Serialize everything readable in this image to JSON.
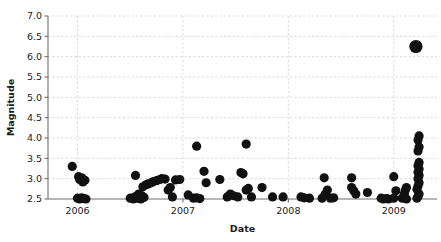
{
  "figure": {
    "background": "#ffffff",
    "marker_color": "#111111",
    "grid_color": "#d8d8d8",
    "axis_color": "#6e6e6e"
  },
  "chart_data": {
    "type": "scatter",
    "title": "",
    "xlabel": "Date",
    "ylabel": "Magnitude",
    "grid": true,
    "legend": null,
    "xlim": [
      2005.72,
      2009.41
    ],
    "ylim": [
      2.45,
      7.05
    ],
    "xticks": [
      2006,
      2007,
      2008,
      2009
    ],
    "xticklabels": [
      "2006",
      "2007",
      "2008",
      "2009"
    ],
    "yticks": [
      2.5,
      3.0,
      3.5,
      4.0,
      4.5,
      5.0,
      5.5,
      6.0,
      6.5,
      7.0
    ],
    "yticklabels": [
      "2.5",
      "3.0",
      "3.5",
      "4.0",
      "4.5",
      "5.0",
      "5.5",
      "6.0",
      "6.5",
      "7.0"
    ],
    "marker_size_default": 4.6,
    "points": [
      {
        "x": 2005.95,
        "y": 3.3
      },
      {
        "x": 2006.01,
        "y": 3.05
      },
      {
        "x": 2006.02,
        "y": 2.98
      },
      {
        "x": 2006.04,
        "y": 3.02
      },
      {
        "x": 2006.05,
        "y": 2.92
      },
      {
        "x": 2006.07,
        "y": 2.96
      },
      {
        "x": 2006.0,
        "y": 2.52
      },
      {
        "x": 2006.02,
        "y": 2.5
      },
      {
        "x": 2006.04,
        "y": 2.53
      },
      {
        "x": 2006.06,
        "y": 2.51
      },
      {
        "x": 2006.08,
        "y": 2.5
      },
      {
        "x": 2006.5,
        "y": 2.52
      },
      {
        "x": 2006.53,
        "y": 2.5
      },
      {
        "x": 2006.55,
        "y": 2.56
      },
      {
        "x": 2006.57,
        "y": 2.52
      },
      {
        "x": 2006.6,
        "y": 2.5
      },
      {
        "x": 2006.58,
        "y": 2.62
      },
      {
        "x": 2006.61,
        "y": 2.58
      },
      {
        "x": 2006.63,
        "y": 2.54
      },
      {
        "x": 2006.55,
        "y": 3.08
      },
      {
        "x": 2006.62,
        "y": 2.8
      },
      {
        "x": 2006.65,
        "y": 2.85
      },
      {
        "x": 2006.67,
        "y": 2.87
      },
      {
        "x": 2006.7,
        "y": 2.9
      },
      {
        "x": 2006.72,
        "y": 2.93
      },
      {
        "x": 2006.75,
        "y": 2.95
      },
      {
        "x": 2006.78,
        "y": 2.98
      },
      {
        "x": 2006.8,
        "y": 3.0
      },
      {
        "x": 2006.83,
        "y": 2.99
      },
      {
        "x": 2006.86,
        "y": 2.72
      },
      {
        "x": 2006.88,
        "y": 2.78
      },
      {
        "x": 2006.9,
        "y": 2.55
      },
      {
        "x": 2006.93,
        "y": 2.97
      },
      {
        "x": 2006.97,
        "y": 2.98
      },
      {
        "x": 2007.05,
        "y": 2.6
      },
      {
        "x": 2007.1,
        "y": 2.52
      },
      {
        "x": 2007.13,
        "y": 2.53
      },
      {
        "x": 2007.16,
        "y": 2.51
      },
      {
        "x": 2007.13,
        "y": 3.8
      },
      {
        "x": 2007.2,
        "y": 3.18
      },
      {
        "x": 2007.22,
        "y": 2.9
      },
      {
        "x": 2007.35,
        "y": 2.98
      },
      {
        "x": 2007.42,
        "y": 2.55
      },
      {
        "x": 2007.45,
        "y": 2.62
      },
      {
        "x": 2007.48,
        "y": 2.58
      },
      {
        "x": 2007.52,
        "y": 2.55
      },
      {
        "x": 2007.55,
        "y": 3.15
      },
      {
        "x": 2007.57,
        "y": 3.12
      },
      {
        "x": 2007.6,
        "y": 2.72
      },
      {
        "x": 2007.62,
        "y": 2.76
      },
      {
        "x": 2007.65,
        "y": 2.55
      },
      {
        "x": 2007.6,
        "y": 3.85
      },
      {
        "x": 2007.75,
        "y": 2.78
      },
      {
        "x": 2007.85,
        "y": 2.55
      },
      {
        "x": 2007.95,
        "y": 2.55
      },
      {
        "x": 2008.12,
        "y": 2.55
      },
      {
        "x": 2008.15,
        "y": 2.53
      },
      {
        "x": 2008.2,
        "y": 2.52
      },
      {
        "x": 2008.32,
        "y": 2.52
      },
      {
        "x": 2008.35,
        "y": 2.62
      },
      {
        "x": 2008.37,
        "y": 2.72
      },
      {
        "x": 2008.34,
        "y": 3.02
      },
      {
        "x": 2008.4,
        "y": 2.52
      },
      {
        "x": 2008.43,
        "y": 2.53
      },
      {
        "x": 2008.6,
        "y": 2.78
      },
      {
        "x": 2008.62,
        "y": 2.7
      },
      {
        "x": 2008.64,
        "y": 2.62
      },
      {
        "x": 2008.6,
        "y": 3.02
      },
      {
        "x": 2008.75,
        "y": 2.66
      },
      {
        "x": 2008.88,
        "y": 2.52
      },
      {
        "x": 2008.9,
        "y": 2.5
      },
      {
        "x": 2008.93,
        "y": 2.51
      },
      {
        "x": 2008.95,
        "y": 2.5
      },
      {
        "x": 2009.0,
        "y": 2.52
      },
      {
        "x": 2009.02,
        "y": 2.7
      },
      {
        "x": 2009.0,
        "y": 3.05
      },
      {
        "x": 2009.08,
        "y": 2.52
      },
      {
        "x": 2009.12,
        "y": 2.5
      },
      {
        "x": 2009.1,
        "y": 2.62
      },
      {
        "x": 2009.11,
        "y": 2.72
      },
      {
        "x": 2009.12,
        "y": 2.78
      },
      {
        "x": 2009.22,
        "y": 2.52
      },
      {
        "x": 2009.23,
        "y": 2.56
      },
      {
        "x": 2009.24,
        "y": 2.62
      },
      {
        "x": 2009.22,
        "y": 2.74
      },
      {
        "x": 2009.23,
        "y": 2.82
      },
      {
        "x": 2009.24,
        "y": 2.9
      },
      {
        "x": 2009.23,
        "y": 3.0
      },
      {
        "x": 2009.24,
        "y": 3.08
      },
      {
        "x": 2009.23,
        "y": 3.16
      },
      {
        "x": 2009.24,
        "y": 3.24
      },
      {
        "x": 2009.23,
        "y": 3.32
      },
      {
        "x": 2009.24,
        "y": 3.4
      },
      {
        "x": 2009.23,
        "y": 3.68
      },
      {
        "x": 2009.24,
        "y": 3.78
      },
      {
        "x": 2009.23,
        "y": 3.95
      },
      {
        "x": 2009.24,
        "y": 4.05
      },
      {
        "x": 2009.21,
        "y": 6.25,
        "size": 6.6
      }
    ]
  }
}
